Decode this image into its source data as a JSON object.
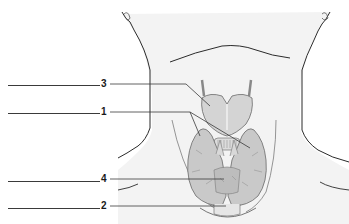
{
  "diagram": {
    "labels": [
      {
        "number": "3",
        "y": 84
      },
      {
        "number": "1",
        "y": 112
      },
      {
        "number": "4",
        "y": 179
      },
      {
        "number": "2",
        "y": 206
      }
    ],
    "answer_lines": [
      {
        "for": "3",
        "blank": ""
      },
      {
        "for": "1",
        "blank": ""
      },
      {
        "for": "4",
        "blank": ""
      },
      {
        "for": "2",
        "blank": ""
      }
    ]
  },
  "colors": {
    "skin_fill": "#f3f3f3",
    "outline": "#2b2b2b",
    "cartilage": "#d4d4d4",
    "thyroid": "#c9c9c9",
    "leader_line": "#3a3a3a"
  }
}
